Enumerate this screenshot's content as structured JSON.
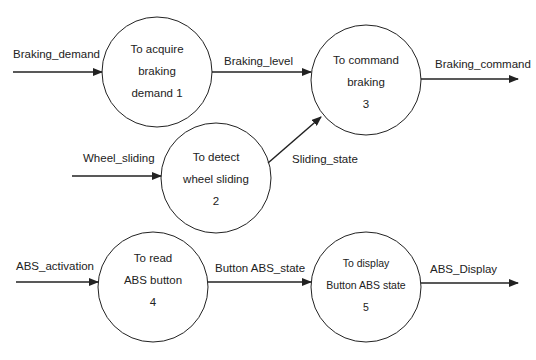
{
  "diagram": {
    "type": "data-flow-diagram",
    "processes": [
      {
        "id": "p1",
        "lines": [
          "To acquire",
          "braking",
          "demand  1"
        ],
        "number": "1",
        "cx": 157,
        "cy": 72,
        "r": 55
      },
      {
        "id": "p2",
        "lines": [
          "To detect",
          "wheel sliding",
          "2"
        ],
        "number": "2",
        "cx": 216,
        "cy": 178,
        "r": 55
      },
      {
        "id": "p3",
        "lines": [
          "To command",
          "braking",
          "3"
        ],
        "number": "3",
        "cx": 366,
        "cy": 80,
        "r": 55
      },
      {
        "id": "p4",
        "lines": [
          "To read",
          "ABS button",
          "4"
        ],
        "number": "4",
        "cx": 153,
        "cy": 287,
        "r": 55
      },
      {
        "id": "p5",
        "lines": [
          "To display",
          "Button ABS state",
          "5"
        ],
        "number": "5",
        "cx": 366,
        "cy": 287,
        "r": 55
      }
    ],
    "flows": [
      {
        "id": "f1",
        "label": "Braking_demand",
        "from": "external",
        "to": "p1"
      },
      {
        "id": "f2",
        "label": "Braking_level",
        "from": "p1",
        "to": "p3"
      },
      {
        "id": "f3",
        "label": "Braking_command",
        "from": "p3",
        "to": "external"
      },
      {
        "id": "f4",
        "label": "Wheel_sliding",
        "from": "external",
        "to": "p2"
      },
      {
        "id": "f5",
        "label": "Sliding_state",
        "from": "p2",
        "to": "p3"
      },
      {
        "id": "f6",
        "label": "ABS_activation",
        "from": "external",
        "to": "p4"
      },
      {
        "id": "f7",
        "label": "Button ABS_state",
        "from": "p4",
        "to": "p5"
      },
      {
        "id": "f8",
        "label": "ABS_Display",
        "from": "p5",
        "to": "external"
      }
    ],
    "colors": {
      "stroke": "#222222",
      "background": "#ffffff",
      "text": "#222222"
    }
  }
}
